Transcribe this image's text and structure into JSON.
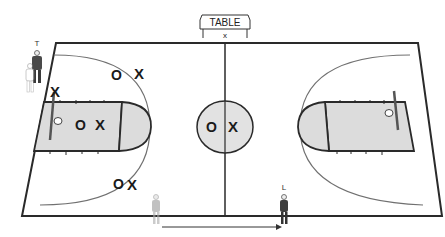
{
  "table": {
    "label": "TABLE",
    "marker": "x"
  },
  "referees": {
    "trail": {
      "label": "T"
    },
    "lead": {
      "label": "L"
    }
  },
  "players": [
    {
      "offense": "O",
      "defense": "X",
      "location": "left wing top"
    },
    {
      "offense": "",
      "defense": "X",
      "location": "left low post baseline"
    },
    {
      "offense": "O",
      "defense": "X",
      "location": "left key center"
    },
    {
      "offense": "O",
      "defense": "X",
      "location": "left wing bottom"
    },
    {
      "offense": "O",
      "defense": "X",
      "location": "center circle"
    }
  ],
  "colors": {
    "court_line": "#2a2a2a",
    "key_fill": "#dcdcdc",
    "arc": "#707070",
    "marker": "#1a1a1a"
  }
}
